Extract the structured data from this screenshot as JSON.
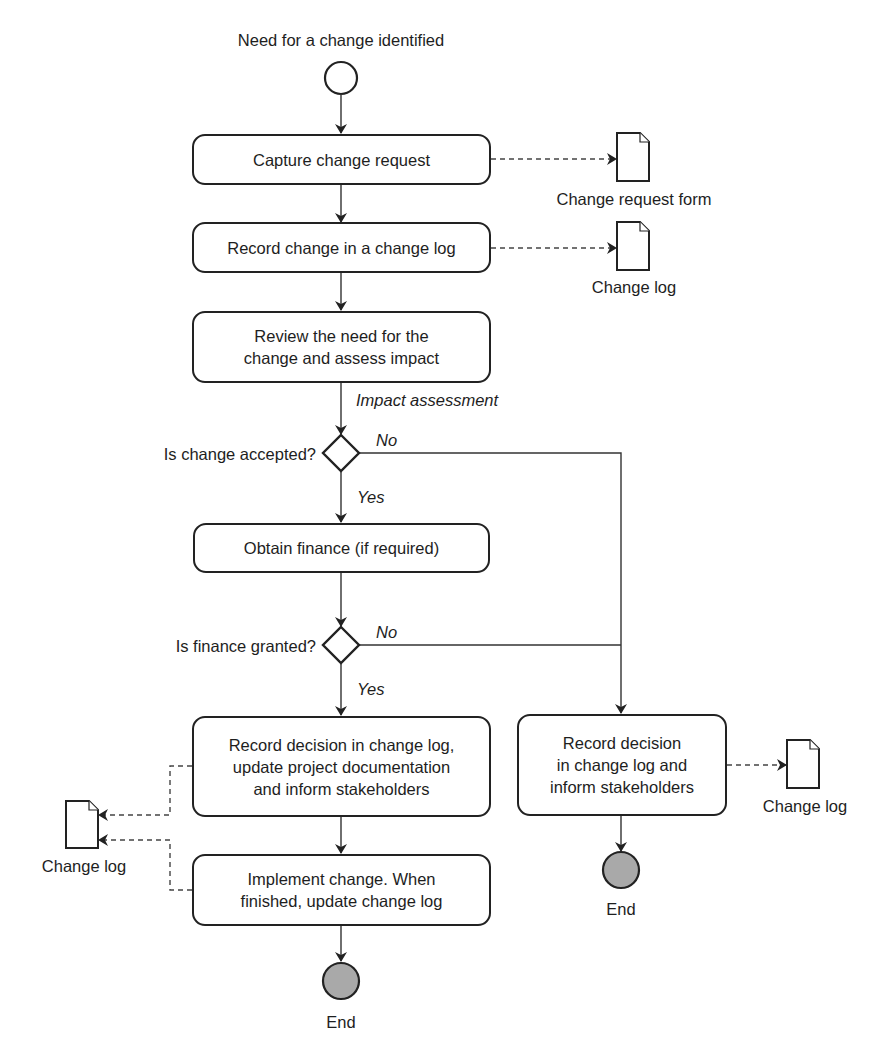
{
  "diagram": {
    "type": "UML activity diagram",
    "start": {
      "label": "Need for a change identified"
    },
    "activities": [
      {
        "id": "capture",
        "lines": [
          "Capture change request"
        ]
      },
      {
        "id": "record",
        "lines": [
          "Record change in a change log"
        ]
      },
      {
        "id": "review",
        "lines": [
          "Review the need for the",
          "change and assess impact"
        ]
      },
      {
        "id": "finance",
        "lines": [
          "Obtain finance (if required)"
        ]
      },
      {
        "id": "record-decision",
        "lines": [
          "Record decision in change log,",
          "update project documentation",
          "and inform stakeholders"
        ]
      },
      {
        "id": "implement",
        "lines": [
          "Implement change. When",
          "finished, update change log"
        ]
      },
      {
        "id": "record-reject",
        "lines": [
          "Record decision",
          "in change log and",
          "inform stakeholders"
        ]
      }
    ],
    "decisions": [
      {
        "id": "accepted",
        "question": "Is change accepted?",
        "yes": "Yes",
        "no": "No"
      },
      {
        "id": "granted",
        "question": "Is finance granted?",
        "yes": "Yes",
        "no": "No"
      }
    ],
    "flow_labels": {
      "impact": "Impact assessment"
    },
    "artifacts": [
      {
        "id": "doc-form",
        "label": "Change request form"
      },
      {
        "id": "doc-log-1",
        "label": "Change log"
      },
      {
        "id": "doc-log-left",
        "label": "Change log"
      },
      {
        "id": "doc-log-right",
        "label": "Change log"
      }
    ],
    "ends": [
      {
        "id": "end-main",
        "label": "End"
      },
      {
        "id": "end-reject",
        "label": "End"
      }
    ],
    "colors": {
      "stroke": "#222222",
      "end_fill": "#a9a9a9",
      "background": "#ffffff"
    }
  }
}
